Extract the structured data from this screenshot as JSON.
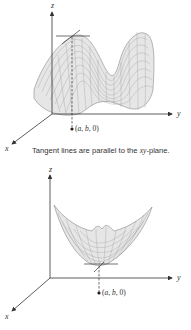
{
  "figures": [
    {
      "id": "top",
      "description": "Surface with local maximum; horizontal tangent lines at peak",
      "axes": {
        "z": "z",
        "y": "y",
        "x": "x"
      },
      "point_label": {
        "prefix": "(",
        "a": "a",
        "sep1": ", ",
        "b": "b",
        "sep2": ", ",
        "zero": "0",
        "suffix": ")"
      },
      "caption": {
        "before": "Tangent lines are parallel to the ",
        "var": "xy",
        "after": "-plane."
      }
    },
    {
      "id": "bottom",
      "description": "Bowl-shaped surface with local minimum; horizontal tangent lines at bottom",
      "axes": {
        "z": "z",
        "y": "y",
        "x": "x"
      },
      "point_label": {
        "prefix": "(",
        "a": "a",
        "sep1": ", ",
        "b": "b",
        "sep2": ", ",
        "zero": "0",
        "suffix": ")"
      }
    }
  ],
  "colors": {
    "axis": "#333333",
    "mesh": "#9a9a9a",
    "surface_fill": "#e6e6e6"
  }
}
